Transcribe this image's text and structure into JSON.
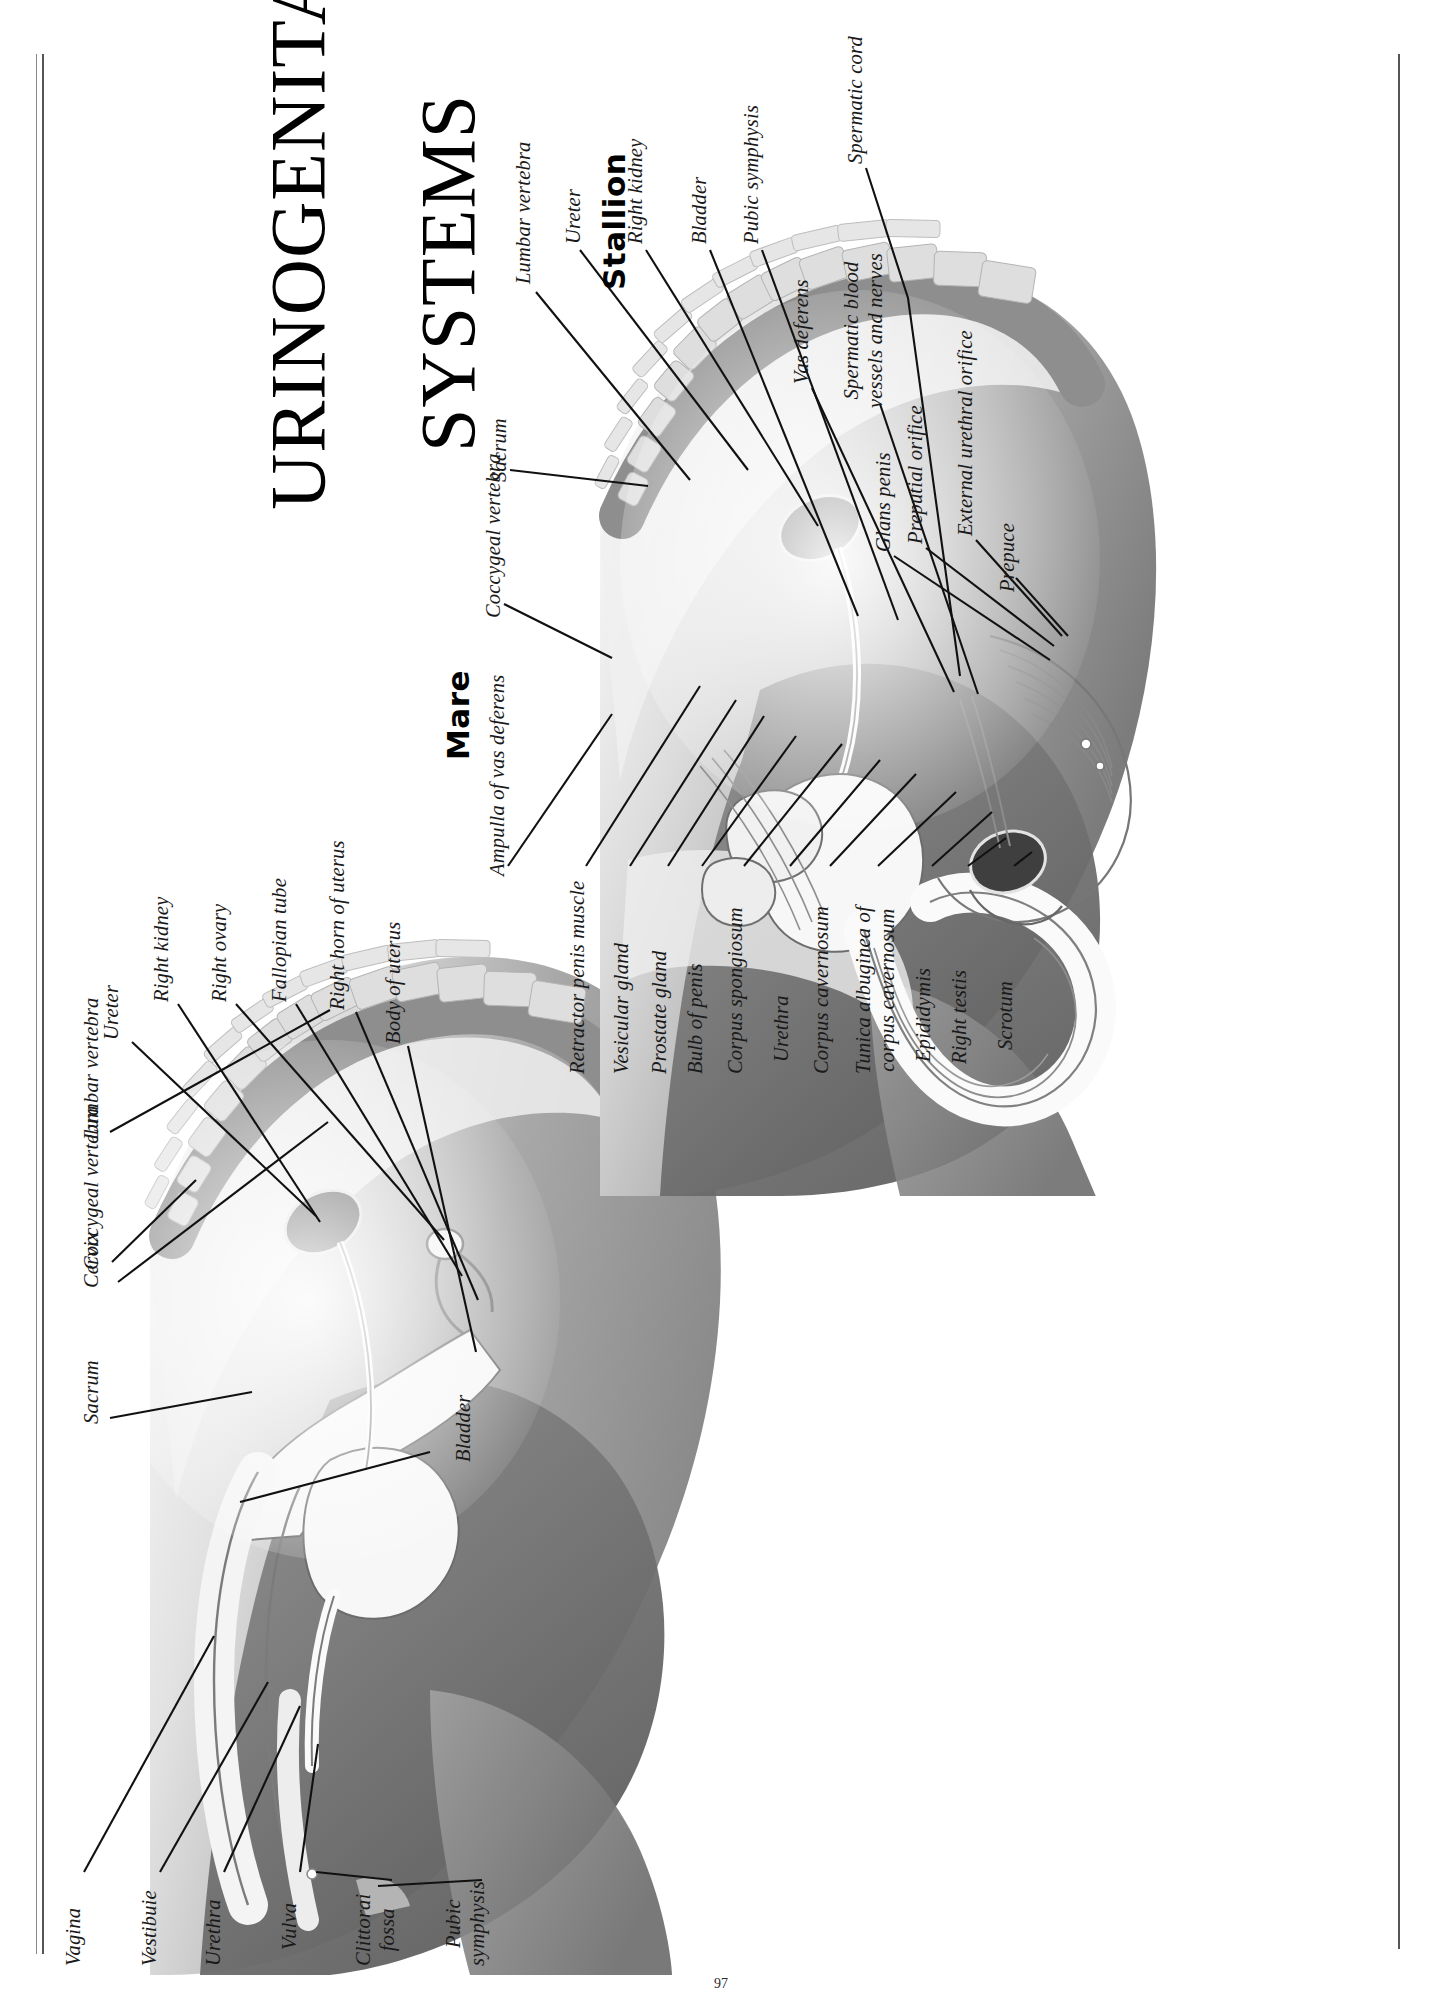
{
  "page": {
    "title_line1": "URINOGENITAL",
    "title_line2": "SYSTEMS",
    "title_full": "URINOGENITAL SYSTEMS",
    "page_number": "97"
  },
  "sections": [
    {
      "id": "mare",
      "heading": "Mare"
    },
    {
      "id": "stallion",
      "heading": "Stallion"
    }
  ],
  "mare": {
    "heading": "Mare",
    "labels": [
      {
        "id": "coccygeal-vertebra",
        "text": "Coccygeal vertebra"
      },
      {
        "id": "sacrum",
        "text": "Sacrum"
      },
      {
        "id": "cervix",
        "text": "Cervix"
      },
      {
        "id": "lumbar-vertebra",
        "text": "Lumbar vertebra"
      },
      {
        "id": "ureter",
        "text": "Ureter"
      },
      {
        "id": "right-kidney",
        "text": "Right kidney"
      },
      {
        "id": "right-ovary",
        "text": "Right ovary"
      },
      {
        "id": "fallopian-tube",
        "text": "Fallopian tube"
      },
      {
        "id": "right-horn-of-uterus",
        "text": "Right horn of uterus"
      },
      {
        "id": "body-of-uterus",
        "text": "Body of uterus"
      },
      {
        "id": "bladder",
        "text": "Bladder"
      },
      {
        "id": "vagina",
        "text": "Vagina"
      },
      {
        "id": "vestibule",
        "text": "Vestibuie"
      },
      {
        "id": "urethra",
        "text": "Urethra"
      },
      {
        "id": "vulva",
        "text": "Vulva"
      },
      {
        "id": "clitoral-fossa",
        "text": "Clittorai\nfossa"
      },
      {
        "id": "pubic-symphysis",
        "text": "Pubic\nsymphysis"
      }
    ]
  },
  "stallion": {
    "heading": "Stallion",
    "labels": [
      {
        "id": "lumbar-vertebra",
        "text": "Lumbar vertebra"
      },
      {
        "id": "ureter",
        "text": "Ureter"
      },
      {
        "id": "right-kidney",
        "text": "Right kidney"
      },
      {
        "id": "bladder",
        "text": "Bladder"
      },
      {
        "id": "pubic-symphysis",
        "text": "Pubic symphysis"
      },
      {
        "id": "vas-deferens",
        "text": "Vas deferens"
      },
      {
        "id": "spermatic-cord",
        "text": "Spermatic cord"
      },
      {
        "id": "spermatic-blood-vessels-and-nerves",
        "text": "Spermatic blood\nvessels and nerves"
      },
      {
        "id": "glans-penis",
        "text": "Glans penis"
      },
      {
        "id": "preputial-orifice",
        "text": "Preputial orifice"
      },
      {
        "id": "external-urethral-orifice",
        "text": "External urethral orifice"
      },
      {
        "id": "prepuce",
        "text": "Prepuce"
      },
      {
        "id": "coccygeal-vertebra",
        "text": "Coccygeal vertebra"
      },
      {
        "id": "sacrum",
        "text": "Sacrum"
      },
      {
        "id": "ampulla-of-vas-deferens",
        "text": "Ampulla of vas deferens"
      },
      {
        "id": "retractor-penis-muscle",
        "text": "Retractor penis muscle"
      },
      {
        "id": "vesicular-gland",
        "text": "Vesicular gland"
      },
      {
        "id": "prostate-gland",
        "text": "Prostate gland"
      },
      {
        "id": "bulb-of-penis",
        "text": "Bulb of penis"
      },
      {
        "id": "corpus-spongiosum",
        "text": "Corpus spongiosum"
      },
      {
        "id": "urethra",
        "text": "Urethra"
      },
      {
        "id": "corpus-cavernosum",
        "text": "Corpus cavernosum"
      },
      {
        "id": "tunica-albuginea-of-corpus-cavernosum",
        "text": "Tunica albuginea of\ncorpus cavernosum"
      },
      {
        "id": "epididymis",
        "text": "Epididymis"
      },
      {
        "id": "right-testis",
        "text": "Right testis"
      },
      {
        "id": "scrotum",
        "text": "Scrotum"
      }
    ]
  },
  "colors": {
    "ink": "#1a1a1a",
    "leader": "#111111",
    "tissue_dark": "#6f6f6f",
    "tissue_mid": "#9b9b9b",
    "tissue_light": "#c9c9c9",
    "bone": "#d8d8d8",
    "organ_white": "#f4f4f4",
    "kidney": "#4a4a4a",
    "background": "#ffffff"
  }
}
